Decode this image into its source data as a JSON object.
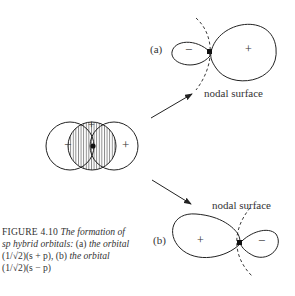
{
  "figure": {
    "number_label": "FIGURE 4.10",
    "caption_line1_italic": "The formation of",
    "caption_line2_italic": "sp hybrid orbitals:",
    "caption_line2_a": "(a)",
    "caption_line2_rest": "the orbital",
    "caption_line3_expr": "(1/√2)(s + p),",
    "caption_line3_b": "(b)",
    "caption_line3_rest": "the orbital",
    "caption_line4_expr": "(1/√2)(s − p)"
  },
  "panel_a": {
    "label": "(a)",
    "small_lobe_sign": "−",
    "large_lobe_sign": "+",
    "nodal_label": "nodal surface"
  },
  "panel_b": {
    "label": "(b)",
    "small_lobe_sign": "−",
    "large_lobe_sign": "+",
    "nodal_label": "nodal surface"
  },
  "overlap": {
    "left_sign": "−",
    "center_sign": "+",
    "right_sign": "+"
  }
}
